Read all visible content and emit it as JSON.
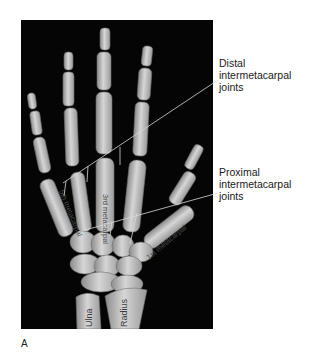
{
  "figure": {
    "panel_letter": "A",
    "background": "#050505",
    "bone_color": "#c9c9c9"
  },
  "callouts": {
    "distal": {
      "lines": [
        "Distal",
        "intermetacarpal",
        "joints"
      ]
    },
    "proximal": {
      "lines": [
        "Proximal",
        "intermetacarpal",
        "joints"
      ]
    }
  },
  "bone_labels": {
    "fifth_metacarpal": "5th metacarpal",
    "third_metacarpal": "3rd metacarpal",
    "first_metacarpal": "1st metacarpal",
    "ulna": "Ulna",
    "radius": "Radius"
  }
}
